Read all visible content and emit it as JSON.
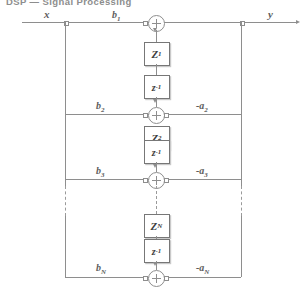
{
  "header": {
    "text": "DSP — Signal Processing"
  },
  "diagram": {
    "input_label": "x",
    "output_label": "y",
    "sum_symbol": "+",
    "delay_label": "z",
    "delay_exponent": "-1",
    "gain_label": "Z",
    "stages": [
      {
        "index": 1,
        "feedforward": "b",
        "feedforward_sub": "1",
        "feedback": "-a",
        "feedback_sub": "1",
        "gain_sub": "1",
        "show_feedback_label": false
      },
      {
        "index": 2,
        "feedforward": "b",
        "feedforward_sub": "2",
        "feedback": "-a",
        "feedback_sub": "2",
        "gain_sub": "2",
        "show_feedback_label": true
      },
      {
        "index": 3,
        "feedforward": "b",
        "feedforward_sub": "3",
        "feedback": "-a",
        "feedback_sub": "3",
        "gain_sub": "N",
        "show_feedback_label": true
      },
      {
        "index": 4,
        "feedforward": "b",
        "feedforward_sub": "N",
        "feedback": "-a",
        "feedback_sub": "N",
        "gain_sub": "N",
        "show_feedback_label": true
      }
    ],
    "continuation": "vertical dotted lines indicating omitted intermediate stages",
    "colors": {
      "wire": "#8e8e8e",
      "block_border": "#777777",
      "text": "#5d5d5d",
      "background": "#ffffff"
    }
  }
}
